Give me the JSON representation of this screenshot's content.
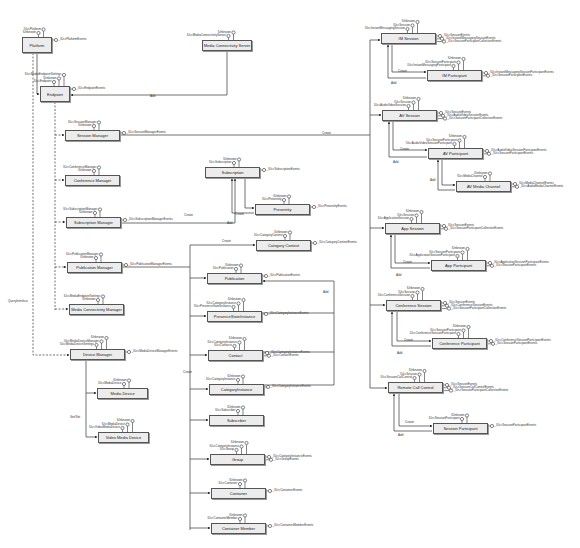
{
  "diagram": {
    "boxes": [
      {
        "id": "platform",
        "label": "Platform",
        "x": 22,
        "y": 37,
        "w": 30,
        "h": 16,
        "ifaces": [
          "IUnknown",
          "IUccPlatform"
        ],
        "events": [
          "_IUccPlatformEvents"
        ]
      },
      {
        "id": "endpoint",
        "label": "Endpoint",
        "x": 40,
        "y": 86,
        "w": 30,
        "h": 16,
        "ifaces": [
          "IUccEndpoint",
          "IUnknown",
          "IUccMediaEndpointSettings"
        ],
        "events": [
          "_IUccEndpointEvents"
        ]
      },
      {
        "id": "media_conn_server",
        "label": "Media Connectivity Server",
        "x": 202,
        "y": 40,
        "w": 50,
        "h": 11,
        "ifaces": [
          "IUccMediaConnectivityServer",
          "IUnknown"
        ],
        "events": []
      },
      {
        "id": "session_manager",
        "label": "Session Manager",
        "x": 65,
        "y": 130,
        "w": 55,
        "h": 11,
        "ifaces": [
          "IUnknown",
          "IUccSessionManager"
        ],
        "events": [
          "_IUccSessionManagerEvents"
        ]
      },
      {
        "id": "conference_manager",
        "label": "Conference Manager",
        "x": 65,
        "y": 175,
        "w": 55,
        "h": 11,
        "ifaces": [
          "IUnknown",
          "IUccConferenceManager"
        ],
        "events": []
      },
      {
        "id": "subscription_manager",
        "label": "Subscription Manager",
        "x": 66,
        "y": 217,
        "w": 55,
        "h": 11,
        "ifaces": [
          "IUnknown",
          "IUccSubscriptionManager"
        ],
        "events": [
          "_IUccSubscriptionManagerEvents"
        ]
      },
      {
        "id": "publication_manager",
        "label": "Publication Manager",
        "x": 67,
        "y": 262,
        "w": 55,
        "h": 11,
        "ifaces": [
          "IUnknown",
          "IUccPublicationManager"
        ],
        "events": [
          "_IUccPublicationManagerEvents"
        ]
      },
      {
        "id": "media_conn_manager",
        "label": "Media Connectivity Manager",
        "x": 69,
        "y": 304,
        "w": 55,
        "h": 11,
        "ifaces": [
          "IUnknown",
          "IUccMediaEndpointSettings"
        ],
        "events": []
      },
      {
        "id": "device_manager",
        "label": "Device Manager",
        "x": 70,
        "y": 349,
        "w": 55,
        "h": 11,
        "ifaces": [
          "IUccMediaDeviceSettings",
          "IUccMediaDeviceManager",
          "IUnknown"
        ],
        "events": [
          "_IUccMediaDeviceManagerEvents"
        ]
      },
      {
        "id": "media_device",
        "label": "Media Device",
        "x": 97,
        "y": 388,
        "w": 51,
        "h": 11,
        "ifaces": [
          "IUccMediaDevice",
          "IUnknown"
        ],
        "events": []
      },
      {
        "id": "video_media_device",
        "label": "Video Media Device",
        "x": 98,
        "y": 432,
        "w": 51,
        "h": 11,
        "ifaces": [
          "IUccVideoMediaDevice",
          "IUccMediaDevice",
          "IUnknown"
        ],
        "events": []
      },
      {
        "id": "subscription",
        "label": "Subscription",
        "x": 205,
        "y": 167,
        "w": 55,
        "h": 11,
        "ifaces": [
          "IUccSubscription",
          "IUnknown"
        ],
        "events": [
          "_IUccSubscriptionEvents"
        ]
      },
      {
        "id": "presentity",
        "label": "Presentity",
        "x": 255,
        "y": 204,
        "w": 55,
        "h": 11,
        "ifaces": [
          "IUccPresentity",
          "IUnknown"
        ],
        "events": [
          "_IUccPresentityEvents"
        ]
      },
      {
        "id": "category_context",
        "label": "Category Context",
        "x": 256,
        "y": 240,
        "w": 55,
        "h": 11,
        "ifaces": [
          "IUccCategoryContext",
          "IUnknown"
        ],
        "events": [
          "_IUccCategoryContextEvents"
        ]
      },
      {
        "id": "publication",
        "label": "Publication",
        "x": 207,
        "y": 273,
        "w": 55,
        "h": 11,
        "ifaces": [
          "IUccPublication",
          "IUnknown"
        ],
        "events": [
          "_IUccPublicationEvents"
        ]
      },
      {
        "id": "presence_state_instance",
        "label": "PresenceStateInstance",
        "x": 207,
        "y": 311,
        "w": 55,
        "h": 11,
        "ifaces": [
          "IUccPresenceStateInstance",
          "IUccCategoryInstance",
          "IUnknown"
        ],
        "events": [
          "_IUccCategoryInstanceEvents"
        ]
      },
      {
        "id": "contact",
        "label": "Contact",
        "x": 208,
        "y": 350,
        "w": 55,
        "h": 11,
        "ifaces": [
          "IUccContacts",
          "IUccCategoryInstance",
          "IUnknown"
        ],
        "events": [
          "_IUccCategoryInstanceEvents",
          "_IUccContactEvents"
        ]
      },
      {
        "id": "category_instance",
        "label": "CategoryInstance",
        "x": 209,
        "y": 384,
        "w": 55,
        "h": 11,
        "ifaces": [
          "IUccCategoryInstance",
          "IUnknown"
        ],
        "events": [
          "_IUccCategoryInstanceEvents"
        ]
      },
      {
        "id": "subscriber",
        "label": "Subscriber",
        "x": 209,
        "y": 415,
        "w": 55,
        "h": 11,
        "ifaces": [
          "IUccSubscriber",
          "IUnknown"
        ],
        "events": []
      },
      {
        "id": "group",
        "label": "Group",
        "x": 210,
        "y": 454,
        "w": 55,
        "h": 11,
        "ifaces": [
          "IUccGroup",
          "IUccCategoryInstance",
          "IUnknown"
        ],
        "events": [
          "_IUccCategoryInstanceEvents",
          "_IUccGroupEvents"
        ]
      },
      {
        "id": "container",
        "label": "Container",
        "x": 211,
        "y": 488,
        "w": 55,
        "h": 11,
        "ifaces": [
          "IUccContainer",
          "IUnknown"
        ],
        "events": [
          "_IUccContainerEvents"
        ]
      },
      {
        "id": "container_member",
        "label": "Container Member",
        "x": 211,
        "y": 523,
        "w": 55,
        "h": 11,
        "ifaces": [
          "IUccContainerMember",
          "IUnknown"
        ],
        "events": [
          "_IUccContainerMemberEvents"
        ]
      },
      {
        "id": "im_session",
        "label": "IM Session",
        "x": 381,
        "y": 33,
        "w": 55,
        "h": 11,
        "ifaces": [
          "IUccInstantMessagingSession",
          "IUccSession",
          "IUnknown"
        ],
        "events": [
          "_IUccSessionEvents",
          "_IUccInstantMessagingSessionEvents",
          "_IUccSessionParticipantCollectionEvents"
        ]
      },
      {
        "id": "im_participant",
        "label": "IM Participant",
        "x": 427,
        "y": 70,
        "w": 55,
        "h": 11,
        "ifaces": [
          "IUccInstantMessagingParticipant",
          "IUccSessionParticipant",
          "IUnknown"
        ],
        "events": [
          "_IUccInstantMessagingSessionParticipantEvents",
          "_IUccSessionParticipantEvents"
        ]
      },
      {
        "id": "av_session",
        "label": "AV Session",
        "x": 382,
        "y": 110,
        "w": 55,
        "h": 11,
        "ifaces": [
          "IUccAudioVideoSession",
          "IUccSession",
          "IUnknown"
        ],
        "events": [
          "_IUccSessionEvents",
          "_IUccAudioVideoSessionEvents",
          "_IUccSessionParticipantCollectionEvents"
        ]
      },
      {
        "id": "av_participant",
        "label": "AV Participant",
        "x": 428,
        "y": 148,
        "w": 55,
        "h": 11,
        "ifaces": [
          "IUccAudioVideoSessionParticipant",
          "IUccSessionParticipant",
          "IUnknown"
        ],
        "events": [
          "_IUccAudioVideoSessionParticipantEvents",
          "_IUccSessionParticipantEvents"
        ]
      },
      {
        "id": "av_media_channel",
        "label": "AV Media Channel",
        "x": 456,
        "y": 181,
        "w": 55,
        "h": 11,
        "ifaces": [
          "IUccMediaChannel",
          "IUnknown"
        ],
        "events": [
          "_IUccMediaChannelEvents",
          "_IUccAudioMediaChannelEvents"
        ]
      },
      {
        "id": "app_session",
        "label": "App Session",
        "x": 385,
        "y": 223,
        "w": 55,
        "h": 11,
        "ifaces": [
          "IUccApplicationSession",
          "IUccSession",
          "IUnknown"
        ],
        "events": [
          "_IUccSessionEvents",
          "_IUccSessionParticipantCollectionEvents"
        ]
      },
      {
        "id": "app_participant",
        "label": "App Participant",
        "x": 431,
        "y": 260,
        "w": 55,
        "h": 11,
        "ifaces": [
          "IUccApplicationSessionParticipant",
          "IUccSessionParticipant",
          "IUnknown"
        ],
        "events": [
          "_IUccApplicationSessionParticipantEvents",
          "_IUccSessionParticipantEvents"
        ]
      },
      {
        "id": "conference_session",
        "label": "Conference Session",
        "x": 386,
        "y": 300,
        "w": 55,
        "h": 11,
        "ifaces": [
          "IUccConferenceSession",
          "IUccSession",
          "IUnknown"
        ],
        "events": [
          "_IUccSessionEvents",
          "_IUccConferenceSessionEvents",
          "_IUccSessionParticipantCollectionEvents"
        ]
      },
      {
        "id": "conference_participant",
        "label": "Conference Participant",
        "x": 432,
        "y": 338,
        "w": 55,
        "h": 11,
        "ifaces": [
          "IUccConferenceSessionParticipant",
          "IUccSessionParticipant",
          "IUnknown"
        ],
        "events": [
          "_IUccConferenceSessionParticipantEvents",
          "_IUccSessionParticipantEvents"
        ]
      },
      {
        "id": "remote_call_control",
        "label": "Remote Call Control",
        "x": 388,
        "y": 382,
        "w": 55,
        "h": 11,
        "ifaces": [
          "IUccSessionCallControl",
          "IUccSession",
          "IUnknown"
        ],
        "events": [
          "_IUccSessionEvents",
          "_IUccSessionCallControlEvents",
          "_IUccSessionParticipantCollectionEvents"
        ]
      },
      {
        "id": "session_participant",
        "label": "Session Participant",
        "x": 433,
        "y": 423,
        "w": 55,
        "h": 11,
        "ifaces": [
          "IUccSessionParticipant",
          "IUnknown"
        ],
        "events": [
          "_IUccSessionParticipantEvents"
        ]
      }
    ],
    "edge_labels": [
      {
        "text": "Add",
        "x": 150,
        "y": 95
      },
      {
        "text": "Create",
        "x": 322,
        "y": 132
      },
      {
        "text": "QueryInterface",
        "x": 8,
        "y": 300
      },
      {
        "text": "Create",
        "x": 235,
        "y": 213
      },
      {
        "text": "Create",
        "x": 184,
        "y": 214
      },
      {
        "text": "Add",
        "x": 227,
        "y": 222
      },
      {
        "text": "Create",
        "x": 222,
        "y": 240
      },
      {
        "text": "Add",
        "x": 323,
        "y": 291
      },
      {
        "text": "Create",
        "x": 183,
        "y": 371
      },
      {
        "text": "Get/Set",
        "x": 70,
        "y": 416
      },
      {
        "text": "Create",
        "x": 398,
        "y": 70
      },
      {
        "text": "Add",
        "x": 391,
        "y": 82
      },
      {
        "text": "Create",
        "x": 400,
        "y": 148
      },
      {
        "text": "Add",
        "x": 393,
        "y": 161
      },
      {
        "text": "Add",
        "x": 430,
        "y": 179
      },
      {
        "text": "Create",
        "x": 403,
        "y": 261
      },
      {
        "text": "Add",
        "x": 396,
        "y": 274
      },
      {
        "text": "Create",
        "x": 404,
        "y": 339
      },
      {
        "text": "Add",
        "x": 397,
        "y": 352
      },
      {
        "text": "Create",
        "x": 405,
        "y": 421
      },
      {
        "text": "Add",
        "x": 398,
        "y": 434
      }
    ]
  }
}
